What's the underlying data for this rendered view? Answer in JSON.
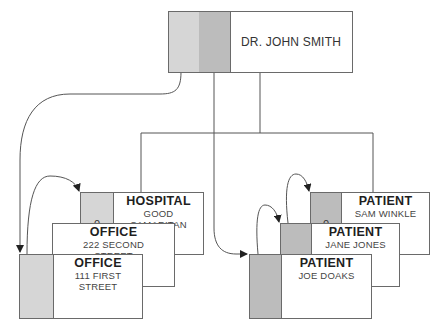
{
  "diagram": {
    "type": "hierarchical database record occurrence diagram",
    "colors": {
      "office_pointer": "#d6d6d6",
      "patient_pointer": "#bcbcbc",
      "line": "#444444"
    },
    "root": {
      "label": "DR. JOHN SMITH"
    },
    "office_chain": [
      {
        "title": "HOSPITAL",
        "line1": "GOOD",
        "line2": "SAMARITAN",
        "pointer": "0"
      },
      {
        "title": "OFFICE",
        "line1": "222 SECOND",
        "line2": "STREET",
        "pointer": ""
      },
      {
        "title": "OFFICE",
        "line1": "111 FIRST",
        "line2": "STREET",
        "pointer": ""
      }
    ],
    "patient_chain": [
      {
        "title": "PATIENT",
        "line1": "SAM WINKLE",
        "pointer": "0"
      },
      {
        "title": "PATIENT",
        "line1": "JANE JONES",
        "pointer": ""
      },
      {
        "title": "PATIENT",
        "line1": "JOE DOAKS",
        "pointer": ""
      }
    ]
  }
}
